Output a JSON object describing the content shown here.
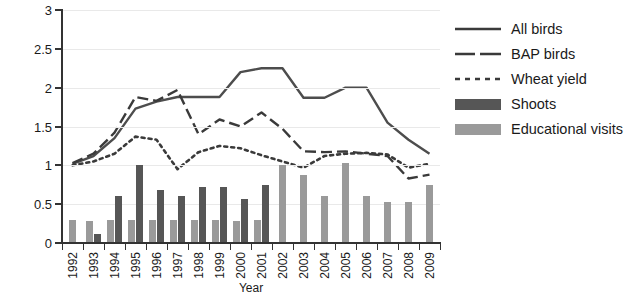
{
  "chart_data": {
    "type": "line",
    "title": "",
    "xlabel": "Year",
    "ylabel": "",
    "ylim": [
      0,
      3
    ],
    "y_ticks": [
      "0",
      "0.5",
      "1",
      "1.5",
      "2",
      "2.5",
      "3"
    ],
    "grid": true,
    "legend_position": "right",
    "categories": [
      "1992",
      "1993",
      "1994",
      "1995",
      "1996",
      "1997",
      "1998",
      "1999",
      "2000",
      "2001",
      "2002",
      "2003",
      "2004",
      "2005",
      "2006",
      "2007",
      "2008",
      "2009"
    ],
    "series": [
      {
        "name": "All birds",
        "style": "solid",
        "color": "#4d4d4d",
        "values": [
          1.02,
          1.12,
          1.35,
          1.73,
          1.82,
          1.88,
          1.88,
          1.88,
          2.2,
          2.25,
          2.25,
          1.87,
          1.87,
          2.0,
          2.0,
          1.55,
          1.33,
          1.15
        ]
      },
      {
        "name": "BAP birds",
        "style": "dashed",
        "color": "#3a3a3a",
        "values": [
          1.03,
          1.15,
          1.42,
          1.88,
          1.83,
          1.97,
          1.4,
          1.59,
          1.5,
          1.68,
          1.47,
          1.18,
          1.17,
          1.18,
          1.15,
          1.12,
          0.83,
          0.88
        ]
      },
      {
        "name": "Wheat yield",
        "style": "dotted",
        "color": "#3a3a3a",
        "values": [
          1.0,
          1.05,
          1.15,
          1.37,
          1.33,
          0.95,
          1.17,
          1.25,
          1.22,
          1.13,
          1.05,
          0.97,
          1.12,
          1.15,
          1.16,
          1.14,
          0.97,
          1.02
        ]
      }
    ],
    "bar_series": [
      {
        "name": "Shoots",
        "color": "#565656",
        "values": [
          null,
          0.12,
          0.6,
          1.0,
          0.68,
          0.6,
          0.72,
          0.72,
          0.57,
          0.75,
          null,
          null,
          null,
          null,
          null,
          null,
          null,
          null
        ]
      },
      {
        "name": "Educational visits",
        "color": "#9a9a9a",
        "values": [
          0.3,
          0.28,
          0.3,
          0.3,
          0.3,
          0.3,
          0.3,
          0.3,
          0.28,
          0.3,
          1.0,
          0.88,
          0.6,
          1.03,
          0.61,
          0.53,
          0.53,
          0.75
        ]
      }
    ]
  },
  "legend": {
    "items": [
      {
        "label": "All birds",
        "key": "line-solid"
      },
      {
        "label": "BAP birds",
        "key": "line-dashed"
      },
      {
        "label": "Wheat yield",
        "key": "line-dotted"
      },
      {
        "label": "Shoots",
        "key": "swatch-dark"
      },
      {
        "label": "Educational visits",
        "key": "swatch-light"
      }
    ]
  }
}
